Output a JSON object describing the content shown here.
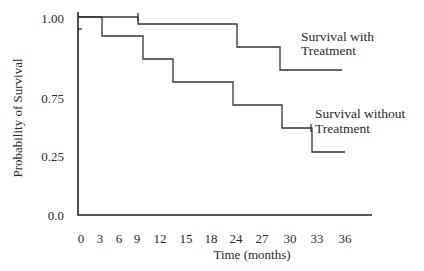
{
  "chart_data": {
    "type": "line",
    "subtype": "kaplan-meier-step",
    "title": "",
    "xlabel": "Time (months)",
    "ylabel": "Probability of Survival",
    "xlim": [
      0,
      36
    ],
    "ylim": [
      0.0,
      1.0
    ],
    "x_ticks": [
      "0",
      "3",
      "6",
      "9",
      "12",
      "15",
      "18",
      "24",
      "27",
      "30",
      "33",
      "36"
    ],
    "y_ticks": [
      "1.00",
      "0.75",
      "0.25",
      "0.0"
    ],
    "grid": false,
    "legend": "inline annotations at right end of each curve",
    "series": [
      {
        "name": "Survival with Treatment",
        "steps": [
          {
            "x": 0,
            "y": 1.0
          },
          {
            "x": 7,
            "y": 0.98
          },
          {
            "x": 19,
            "y": 0.91
          },
          {
            "x": 24,
            "y": 0.84
          }
        ],
        "end_x": 32
      },
      {
        "name": "Survival without Treatment",
        "steps": [
          {
            "x": 0,
            "y": 1.0
          },
          {
            "x": 3,
            "y": 0.94
          },
          {
            "x": 8,
            "y": 0.87
          },
          {
            "x": 12,
            "y": 0.8
          },
          {
            "x": 19,
            "y": 0.73
          },
          {
            "x": 25,
            "y": 0.66
          },
          {
            "x": 28,
            "y": 0.58
          }
        ],
        "end_x": 33
      }
    ]
  },
  "render": {
    "axis": {
      "x0": 78,
      "y_top": 12,
      "y0": 215,
      "x_end": 372
    },
    "y_tick_labels": [
      {
        "text": "1.00",
        "y": 23
      },
      {
        "text": "0.75",
        "y": 103
      },
      {
        "text": "0.25",
        "y": 161
      },
      {
        "text": "0.0",
        "y": 220
      }
    ],
    "y_minor_tick_y": 29,
    "x_tick_labels": [
      {
        "text": "0",
        "x": 81
      },
      {
        "text": "3",
        "x": 100
      },
      {
        "text": "6",
        "x": 119
      },
      {
        "text": "9",
        "x": 137
      },
      {
        "text": "12",
        "x": 160
      },
      {
        "text": "15",
        "x": 186
      },
      {
        "text": "18",
        "x": 211
      },
      {
        "text": "24",
        "x": 236
      },
      {
        "text": "27",
        "x": 262
      },
      {
        "text": "30",
        "x": 290
      },
      {
        "text": "33",
        "x": 317
      },
      {
        "text": "36",
        "x": 345
      }
    ],
    "x_tick_label_y": 243,
    "with_path": "M78 17 L138 17 L138 24 L237 24 L237 47 L280 47 L280 70 L342 70",
    "without_path": "M78 17 L102 17 L102 36 L143 36 L143 59 L173 59 L173 82 L233 82 L233 105 L282 105 L282 128 L312 128 L312 152 L345 152",
    "censor_ticks": [
      {
        "x": 138,
        "y1": 13,
        "y2": 21
      },
      {
        "x": 311,
        "y1": 124,
        "y2": 132
      }
    ],
    "annotations": {
      "with_line1": {
        "text": "Survival with",
        "x": 301,
        "y": 41
      },
      "with_line2": {
        "text": "Treatment",
        "x": 301,
        "y": 55
      },
      "without_line1": {
        "text": "Survival without",
        "x": 315,
        "y": 118
      },
      "without_line2": {
        "text": "Treatment",
        "x": 315,
        "y": 133
      }
    },
    "xlabel_pos": {
      "x": 252,
      "y": 259
    },
    "ylabel_pos": {
      "x": 22,
      "y": 118
    }
  }
}
